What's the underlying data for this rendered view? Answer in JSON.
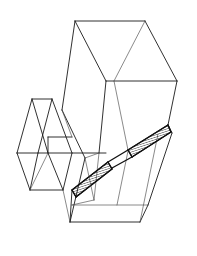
{
  "document": {
    "title": "Wireframe Line Drawing",
    "subject": "axonometric wireframe of a hopper / bin with an inclined hatched chute",
    "medium": "black ink line drawing on white background",
    "canvas": {
      "width": 197,
      "height": 256,
      "background": "#ffffff"
    },
    "visible_text": [],
    "labels": [],
    "annotations": []
  },
  "style": {
    "line_color": "#1a1a1a",
    "thin_line_color": "#4a4a4a",
    "bold_line_color": "#111111",
    "hatch_color": "#111111",
    "fill_color": "#ffffff",
    "line_width": 0.9,
    "thin_line_width": 0.65,
    "bold_line_width": 1.35
  },
  "geometry": {
    "description": "Single line-art figure: a large upper box shown in axonometric projection, a smaller box wing at the left, a tapering lower chute at the right, and a two-segment hatched ramp band crossing the middle.",
    "vertices": {
      "top_back_left": [
        75,
        21
      ],
      "top_back_right": [
        145,
        21
      ],
      "top_front_center": [
        106,
        81
      ],
      "top_front_right": [
        177,
        81
      ],
      "mid_left_upper": [
        62,
        110
      ],
      "mid_body_left": [
        85,
        158
      ],
      "mid_body_center": [
        99,
        153
      ],
      "right_upper": [
        168,
        125
      ],
      "right_mid": [
        172,
        133
      ],
      "bottom_left": [
        70,
        222
      ],
      "bottom_right": [
        140,
        222
      ],
      "bottom_mid_right": [
        148,
        205
      ],
      "wing_top_left": [
        32,
        99
      ],
      "wing_top_right": [
        52,
        99
      ],
      "wing_left": [
        17,
        153
      ],
      "wing_right": [
        72,
        153
      ],
      "wing_bottom_left": [
        30,
        190
      ],
      "wing_bottom_right": [
        63,
        190
      ],
      "ramp_upper_start": [
        128,
        150
      ],
      "ramp_upper_end": [
        168,
        126
      ],
      "ramp_kink": [
        112,
        166
      ],
      "ramp_lower_start": [
        72,
        190
      ],
      "ramp_lower_end": [
        104,
        172
      ]
    },
    "parts": [
      {
        "name": "upper-box",
        "kind": "open-top parallelepiped"
      },
      {
        "name": "left-wing-box",
        "kind": "small open box at left"
      },
      {
        "name": "lower-chute",
        "kind": "tapering wedge at lower right"
      },
      {
        "name": "hatched-ramp",
        "kind": "two-segment hatched band",
        "segments": 2
      }
    ]
  },
  "chart_data": {
    "type": "line",
    "title": "",
    "xlabel": "",
    "ylabel": "",
    "grid": false,
    "legend": "none",
    "note": "Not a data chart — technical line illustration. Paths listed as polyline coordinate series."
  }
}
